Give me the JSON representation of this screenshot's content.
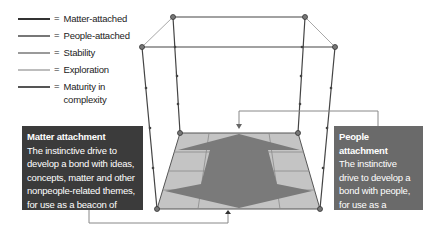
{
  "legend": {
    "items": [
      {
        "label": "Matter-attached",
        "color": "#333333"
      },
      {
        "label": "People-attached",
        "color": "#777777"
      },
      {
        "label": "Stability",
        "color": "#9a9a9a"
      },
      {
        "label": "Exploration",
        "color": "#bdbdbd"
      },
      {
        "label": "Maturity in complexity",
        "color": "#555555"
      }
    ],
    "equals": "="
  },
  "matter_box": {
    "title": "Matter attachment",
    "body": "The instinctive drive to develop a bond with ideas, concepts, matter and other nonpeople-related themes, for use as a beacon of safety",
    "color": "#3b3b3b"
  },
  "people_box": {
    "title": "People attachment",
    "body": "The instinctive drive to develop a bond with people, for use as a beacon of safety",
    "color": "#6a6a6a"
  },
  "colors": {
    "floor": "#c4c4c4",
    "arrow": "#7a7a7a",
    "frame": "#444444",
    "frame_light": "#a8a8a8",
    "connector": "#888888"
  }
}
